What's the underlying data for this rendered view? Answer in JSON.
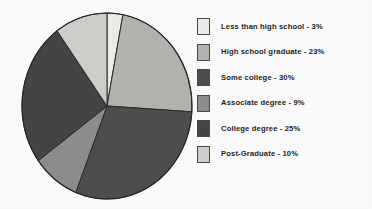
{
  "chart_data": {
    "type": "pie",
    "title": "",
    "subtitle": "",
    "xlabel": "",
    "ylabel": "",
    "legend_position": "right",
    "grid": false,
    "categories": [
      "Less than high school",
      "High school graduate",
      "Some college",
      "Associate degree",
      "College degree",
      "Post-Graduate"
    ],
    "values": [
      3,
      23,
      30,
      9,
      25,
      10
    ],
    "value_unit": "%",
    "total": 100,
    "start_angle_deg": 0,
    "direction": "clockwise",
    "slice_colors": [
      "#ededea",
      "#b4b4b1",
      "#4e4e4e",
      "#8e8e8c",
      "#454545",
      "#cfcfcb"
    ],
    "outline_color": "#2a2a2a",
    "slices": [
      {
        "label": "Less than high school",
        "value": 3,
        "percent_text": "3%",
        "color": "#ededea",
        "legend_text": "Less than high school - 3%"
      },
      {
        "label": "High school graduate",
        "value": 23,
        "percent_text": "23%",
        "color": "#b4b4b1",
        "legend_text": "High school graduate - 23%"
      },
      {
        "label": "Some college",
        "value": 30,
        "percent_text": "30%",
        "color": "#4e4e4e",
        "legend_text": "Some college - 30%"
      },
      {
        "label": "Associate degree",
        "value": 9,
        "percent_text": "9%",
        "color": "#8e8e8c",
        "legend_text": "Associate degree - 9%"
      },
      {
        "label": "College degree",
        "value": 25,
        "percent_text": "25%",
        "color": "#454545",
        "legend_text": "College degree - 25%"
      },
      {
        "label": "Post-Graduate",
        "value": 10,
        "percent_text": "10%",
        "color": "#cfcfcb",
        "legend_text": "Post-Graduate - 10%"
      }
    ]
  },
  "legend": {
    "items": [
      {
        "text": "Less than high school - 3%",
        "color": "#ededea"
      },
      {
        "text": "High school graduate - 23%",
        "color": "#b4b4b1"
      },
      {
        "text": "Some college - 30%",
        "color": "#4e4e4e"
      },
      {
        "text": "Associate degree - 9%",
        "color": "#8e8e8c"
      },
      {
        "text": "College degree - 25%",
        "color": "#454545"
      },
      {
        "text": "Post-Graduate - 10%",
        "color": "#cfcfcb"
      }
    ]
  }
}
